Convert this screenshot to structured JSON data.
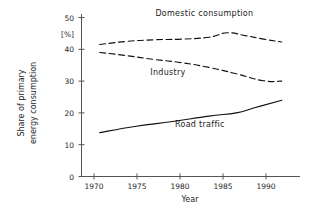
{
  "chart_data": {
    "type": "line",
    "title": "",
    "xlabel": "Year",
    "ylabel": "Share of primary energy consumption",
    "ylabel_line1": "Share of  primary",
    "ylabel_line2": "energy consumption",
    "yunit": "[%]",
    "xlim": [
      1968,
      1992
    ],
    "ylim": [
      0,
      52
    ],
    "xticks": [
      1970,
      1975,
      1980,
      1985,
      1990
    ],
    "xticklabels": [
      "1970",
      "1975",
      "1980",
      "1985",
      "1990"
    ],
    "yticks": [
      0,
      10,
      20,
      30,
      40,
      50
    ],
    "yticklabels": [
      "0",
      "10",
      "20",
      "30",
      "40",
      "50"
    ],
    "grid": false,
    "legend_position": "inline-annotations",
    "line_color": "#111111",
    "axis_color": "#555555",
    "background": "#ffffff",
    "series": [
      {
        "name": "Domestic consumption",
        "style": "dashed",
        "label_x": 1981.5,
        "label_y": 50.5,
        "x": [
          1970,
          1973,
          1976,
          1979,
          1982,
          1984,
          1986,
          1988,
          1990
        ],
        "values": [
          41.5,
          42.5,
          43.0,
          43.2,
          43.8,
          45.2,
          44.3,
          43.2,
          42.3
        ]
      },
      {
        "name": "Industry",
        "style": "dashed",
        "label_x": 1977.5,
        "label_y": 32.0,
        "x": [
          1970,
          1973,
          1976,
          1979,
          1982,
          1985,
          1988,
          1990
        ],
        "values": [
          39.0,
          38.0,
          36.8,
          35.8,
          34.3,
          32.3,
          30.1,
          30.0
        ]
      },
      {
        "name": "Road traffic",
        "style": "solid",
        "label_x": 1981.0,
        "label_y": 15.5,
        "x": [
          1970,
          1974,
          1978,
          1982,
          1985,
          1987,
          1990
        ],
        "values": [
          13.8,
          15.8,
          17.3,
          19.0,
          20.0,
          21.6,
          24.0
        ]
      }
    ]
  }
}
